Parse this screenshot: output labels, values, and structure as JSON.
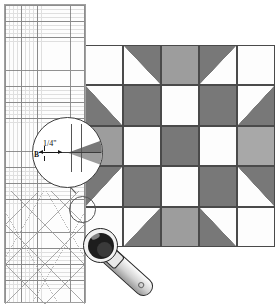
{
  "scene": {
    "title": "Quilting rotary-cutting diagram",
    "description": "Transparent quilter's ruler overlaying an eight-point star quilt block, with a magnified seam-allowance callout and a rotary cutter."
  },
  "ruler": {
    "name": "quilting-ruler",
    "grid_major_spacing_label": "1\"",
    "grid_minor_spacing_label": "1/4\"",
    "angle_lines": [
      "45",
      "60",
      "30"
    ]
  },
  "callout": {
    "magnifier_label": "magnified seam detail",
    "seam_allowance": "1/4\"",
    "piece_label": "B"
  },
  "tool": {
    "name": "rotary-cutter"
  },
  "colors": {
    "fabric_white": "#fdfdfd",
    "fabric_dark_gray": "#787878",
    "fabric_medium_gray": "#9d9d9d",
    "fabric_light_gray": "#a8a8a8",
    "seam_line": "#4a4a4a",
    "ruler_line": "#6e6e6e",
    "background": "#ffffff"
  },
  "quilt_block": {
    "name": "eight-point-star-block",
    "rows": 5,
    "cols": 5,
    "cells": [
      [
        {
          "fill": "white",
          "shape": "square"
        },
        {
          "fill": "white",
          "shape": "hst",
          "corner": "tr",
          "tri": "dark"
        },
        {
          "fill": "mid",
          "shape": "square"
        },
        {
          "fill": "white",
          "shape": "hst",
          "corner": "tl",
          "tri": "dark"
        },
        {
          "fill": "white",
          "shape": "square"
        }
      ],
      [
        {
          "fill": "white",
          "shape": "hst",
          "corner": "bl",
          "tri": "dark"
        },
        {
          "fill": "dark",
          "shape": "square"
        },
        {
          "fill": "white",
          "shape": "square"
        },
        {
          "fill": "dark",
          "shape": "square"
        },
        {
          "fill": "white",
          "shape": "hst",
          "corner": "br",
          "tri": "dark"
        }
      ],
      [
        {
          "fill": "mid",
          "shape": "square"
        },
        {
          "fill": "white",
          "shape": "square"
        },
        {
          "fill": "dark",
          "shape": "square"
        },
        {
          "fill": "white",
          "shape": "square"
        },
        {
          "fill": "light",
          "shape": "square"
        }
      ],
      [
        {
          "fill": "white",
          "shape": "hst",
          "corner": "tl",
          "tri": "dark"
        },
        {
          "fill": "dark",
          "shape": "square"
        },
        {
          "fill": "white",
          "shape": "square"
        },
        {
          "fill": "dark",
          "shape": "square"
        },
        {
          "fill": "white",
          "shape": "hst",
          "corner": "tr",
          "tri": "dark"
        }
      ],
      [
        {
          "fill": "white",
          "shape": "square"
        },
        {
          "fill": "white",
          "shape": "hst",
          "corner": "br",
          "tri": "dark"
        },
        {
          "fill": "mid",
          "shape": "square"
        },
        {
          "fill": "white",
          "shape": "hst",
          "corner": "bl",
          "tri": "dark"
        },
        {
          "fill": "white",
          "shape": "square"
        }
      ]
    ]
  }
}
